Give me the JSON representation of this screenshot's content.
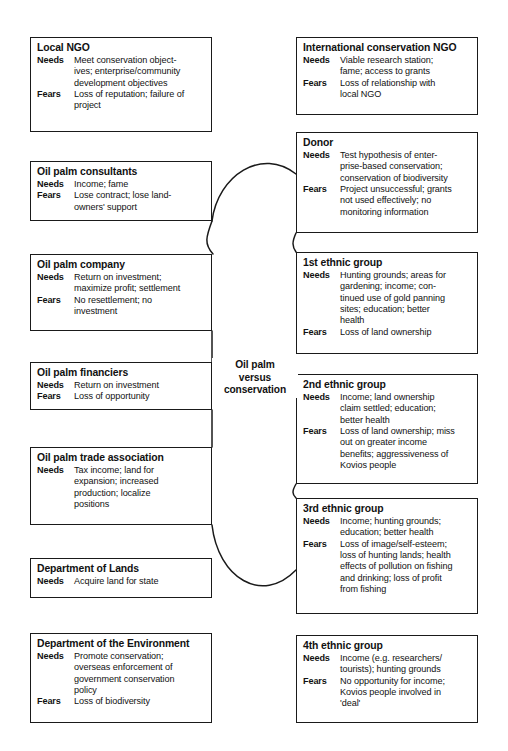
{
  "diagram": {
    "center_label": "Oil palm\nversus\nconservation",
    "needs_label": "Needs",
    "fears_label": "Fears",
    "colors": {
      "border": "#1a1a1a",
      "background": "#ffffff",
      "text": "#111111",
      "connector": "#1a1a1a"
    },
    "boxes": [
      {
        "id": "local-ngo",
        "side": "left",
        "title": "Local NGO",
        "needs": "Meet conservation object-\nives; enterprise/community\ndevelopment objectives",
        "fears": "Loss of reputation; failure of\nproject",
        "x": 30,
        "y": 37,
        "w": 182,
        "h": 95
      },
      {
        "id": "oil-palm-consultants",
        "side": "left",
        "title": "Oil palm consultants",
        "needs": "Income; fame",
        "fears": "Lose contract; lose land-\nowners' support",
        "x": 30,
        "y": 161,
        "w": 182,
        "h": 60
      },
      {
        "id": "oil-palm-company",
        "side": "left",
        "title": "Oil palm company",
        "needs": "Return on investment;\nmaximize profit; settlement",
        "fears": "No resettlement; no\ninvestment",
        "x": 30,
        "y": 254,
        "w": 182,
        "h": 77
      },
      {
        "id": "oil-palm-financiers",
        "side": "left",
        "title": "Oil palm financiers",
        "needs": "Return on investment",
        "fears": "Loss of opportunity",
        "x": 30,
        "y": 362,
        "w": 182,
        "h": 48
      },
      {
        "id": "oil-palm-trade-association",
        "side": "left",
        "title": "Oil palm trade association",
        "needs": "Tax income; land for\nexpansion; increased\nproduction; localize\npositions",
        "fears": "",
        "x": 30,
        "y": 447,
        "w": 182,
        "h": 78
      },
      {
        "id": "department-of-lands",
        "side": "left",
        "title": "Department of Lands",
        "needs": "Acquire land for state",
        "fears": "",
        "x": 30,
        "y": 558,
        "w": 182,
        "h": 40
      },
      {
        "id": "department-of-the-environment",
        "side": "left",
        "title": "Department of the Environment",
        "needs": "Promote conservation;\noverseas enforcement of\ngovernment conservation\npolicy",
        "fears": "Loss of biodiversity",
        "x": 30,
        "y": 633,
        "w": 182,
        "h": 90
      },
      {
        "id": "international-conservation-ngo",
        "side": "right",
        "title": "International conservation NGO",
        "needs": "Viable research station;\nfame; access to grants",
        "fears": "Loss of relationship with\nlocal NGO",
        "x": 296,
        "y": 37,
        "w": 182,
        "h": 78
      },
      {
        "id": "donor",
        "side": "right",
        "title": "Donor",
        "needs": "Test hypothesis of enter-\nprise-based conservation;\nconservation of biodiversity",
        "fears": "Project unsuccessful; grants\nnot used effectively; no\nmonitoring information",
        "x": 296,
        "y": 132,
        "w": 182,
        "h": 101
      },
      {
        "id": "1st-ethnic-group",
        "side": "right",
        "title": "1st ethnic group",
        "needs": "Hunting grounds; areas for\ngardening; income; con-\ntinued use of gold panning\nsites; education; better\nhealth",
        "fears": "Loss of land ownership",
        "x": 296,
        "y": 252,
        "w": 182,
        "h": 102
      },
      {
        "id": "2nd-ethnic-group",
        "side": "right",
        "title": "2nd ethnic group",
        "needs": "Income; land ownership\nclaim settled; education;\nbetter health",
        "fears": "Loss of land ownership; miss\nout on greater income\nbenefits; aggressiveness of\nKovios people",
        "x": 296,
        "y": 374,
        "w": 182,
        "h": 110
      },
      {
        "id": "3rd-ethnic-group",
        "side": "right",
        "title": "3rd ethnic group",
        "needs": "Income; hunting grounds;\neducation; better health",
        "fears": "Loss of image/self-esteem;\nloss of hunting lands; health\neffects of pollution on fishing\nand drinking; loss of profit\nfrom fishing",
        "x": 296,
        "y": 498,
        "w": 182,
        "h": 116
      },
      {
        "id": "4th-ethnic-group",
        "side": "right",
        "title": "4th ethnic group",
        "needs": "Income (e.g. researchers/\ntourists); hunting grounds",
        "fears": "No opportunity for income;\nKovios people involved in\n'deal'",
        "x": 296,
        "y": 635,
        "w": 182,
        "h": 88
      }
    ],
    "connectors": [
      {
        "id": "consultants-to-company",
        "path": "M 212 221 C 206 237 204 244 213 254"
      },
      {
        "id": "company-to-financiers",
        "path": "M 212 331 L 212 362"
      },
      {
        "id": "financiers-to-trade-association",
        "path": "M 212 410 L 212 447"
      },
      {
        "id": "donor-to-1st-ethnic",
        "path": "M 296 233 C 292 242 292 246 296 252"
      },
      {
        "id": "2nd-to-3rd-ethnic",
        "path": "M 296 484 C 292 491 292 494 296 498"
      },
      {
        "id": "top-arc",
        "path": "M 212 221 C 218 175 262 147 296 174"
      },
      {
        "id": "bottom-arc",
        "path": "M 212 525 C 218 578 262 605 296 570"
      }
    ]
  }
}
